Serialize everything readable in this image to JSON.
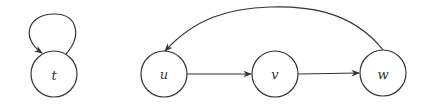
{
  "diagram": {
    "type": "directed-graph",
    "colors": {
      "stroke": "#333333",
      "background": "#ffffff",
      "label": "#333333"
    },
    "nodes": [
      {
        "id": "t",
        "label": "t",
        "cx": 54,
        "cy": 74,
        "r": 23
      },
      {
        "id": "u",
        "label": "u",
        "cx": 164,
        "cy": 74,
        "r": 23
      },
      {
        "id": "v",
        "label": "v",
        "cx": 275,
        "cy": 74,
        "r": 23
      },
      {
        "id": "w",
        "label": "w",
        "cx": 383,
        "cy": 73,
        "r": 23
      }
    ],
    "edges": [
      {
        "from": "t",
        "to": "t",
        "kind": "self-loop"
      },
      {
        "from": "u",
        "to": "v",
        "kind": "straight"
      },
      {
        "from": "v",
        "to": "w",
        "kind": "straight"
      },
      {
        "from": "w",
        "to": "u",
        "kind": "curved-arc"
      }
    ]
  }
}
